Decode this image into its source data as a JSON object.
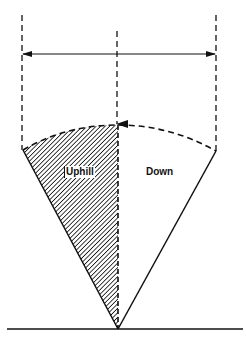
{
  "diagram": {
    "labels": {
      "uphill": "Uphill",
      "down": "Down"
    },
    "colors": {
      "stroke": "#111111",
      "background": "#ffffff",
      "hatch": "#111111"
    },
    "geometry": {
      "apex": [
        118,
        329
      ],
      "left_corner": [
        23,
        150
      ],
      "right_corner": [
        216,
        151
      ],
      "arc_top": [
        118,
        125
      ],
      "ground_y": 329,
      "ground_x_range": [
        7,
        243
      ],
      "width_arrow_y": 54,
      "left_guide_x": 22,
      "right_guide_x": 216,
      "center_guide_x": 117,
      "center_guide_top_y": 31,
      "side_guides_top_y": 15
    },
    "elements": [
      "ground-line",
      "left-dashed-guide",
      "right-dashed-guide",
      "center-dashed-axis-with-arrow",
      "double-headed-width-arrow",
      "dashed-arc",
      "hatched-uphill-sector",
      "blank-down-sector"
    ]
  }
}
